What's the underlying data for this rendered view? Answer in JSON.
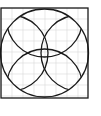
{
  "diagram": {
    "colors": {
      "stroke": "#1a1a1a",
      "grid": "#d9d9d9",
      "background": "#ffffff"
    },
    "square": {
      "x": 1,
      "y": 8,
      "width": 87,
      "height": 90
    },
    "outer_circle": {
      "cx": 44.5,
      "cy": 53,
      "r": 44
    },
    "inner_arcs": [
      {
        "name": "top-arc",
        "cx": 44.5,
        "cy": 87,
        "r": 38
      },
      {
        "name": "bottom-arc",
        "cx": 44.5,
        "cy": 19,
        "r": 38
      },
      {
        "name": "left-arc",
        "cx": 79,
        "cy": 53,
        "r": 38
      },
      {
        "name": "right-arc",
        "cx": 10,
        "cy": 53,
        "r": 38
      }
    ],
    "grid": {
      "spacing": 11
    }
  }
}
